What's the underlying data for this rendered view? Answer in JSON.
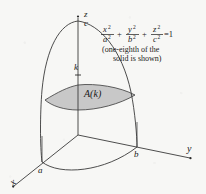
{
  "figure": {
    "type": "ellipsoid-octant-cross-section",
    "background_color": "#f7f7f5",
    "ink_color": "#1a1a1a",
    "shade_color": "#c8c8c8",
    "axis_labels": {
      "z": "z",
      "y": "y",
      "x": "x"
    },
    "intercept_labels": {
      "c": "c",
      "a": "a",
      "b": "b"
    },
    "height_label": "k",
    "area_label": "A(k)",
    "equation": {
      "term1_num": "x",
      "term1_den": "a",
      "term2_num": "y",
      "term2_den": "b",
      "term3_num": "z",
      "term3_den": "c",
      "exponent": "2",
      "plus": "+",
      "equals": "=1"
    },
    "caption_line1": "(one-eighth of the",
    "caption_line2": "solid is shown)"
  }
}
